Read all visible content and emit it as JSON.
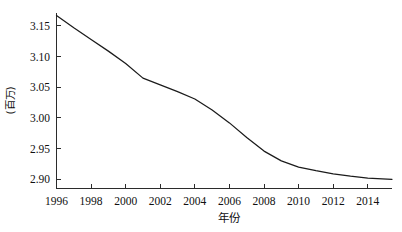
{
  "chart_data": {
    "type": "line",
    "title": "",
    "subtitle": "",
    "xlabel": "年份",
    "ylabel": "(百万)",
    "grid": false,
    "legend": null,
    "legend_position": "none",
    "line_color": "#1b1b1b",
    "background_color": "#ffffff",
    "xlim": [
      1996,
      2015.4
    ],
    "ylim": [
      2.885,
      3.172
    ],
    "xticks": [
      1996,
      1998,
      2000,
      2002,
      2004,
      2006,
      2008,
      2010,
      2012,
      2014
    ],
    "xtick_labels": [
      "1996",
      "1998",
      "2000",
      "2002",
      "2004",
      "2006",
      "2008",
      "2010",
      "2012",
      "2014"
    ],
    "yticks": [
      2.9,
      2.95,
      3.0,
      3.05,
      3.1,
      3.15
    ],
    "ytick_labels": [
      "2.90",
      "2.95",
      "3.00",
      "3.05",
      "3.10",
      "3.15"
    ],
    "x": [
      1996,
      1997,
      1998,
      1999,
      2000,
      2001,
      2002,
      2003,
      2004,
      2005,
      2006,
      2007,
      2008,
      2009,
      2010,
      2011,
      2012,
      2013,
      2014,
      2015.4
    ],
    "values": [
      3.167,
      3.147,
      3.128,
      3.109,
      3.089,
      3.065,
      3.054,
      3.043,
      3.031,
      3.013,
      2.992,
      2.968,
      2.946,
      2.93,
      2.92,
      2.914,
      2.909,
      2.905,
      2.902,
      2.9
    ],
    "series": [
      {
        "name": "",
        "values": [
          3.167,
          3.147,
          3.128,
          3.109,
          3.089,
          3.065,
          3.054,
          3.043,
          3.031,
          3.013,
          2.992,
          2.968,
          2.946,
          2.93,
          2.92,
          2.914,
          2.909,
          2.905,
          2.902,
          2.9
        ]
      }
    ],
    "annotations": []
  }
}
